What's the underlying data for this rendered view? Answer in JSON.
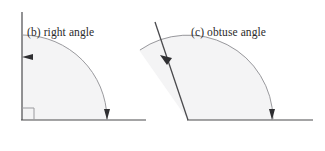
{
  "figure": {
    "width": 325,
    "height": 151,
    "background_color": "#ffffff",
    "line_color": "#3a3a3a",
    "sector_fill_color": "#f4f4f5",
    "sector_stroke_color": "#9b9b9b",
    "text_color": "#2b2b2b"
  },
  "panels": [
    {
      "id": "right-angle",
      "caption": "(b) right angle",
      "angle_degrees": 90,
      "vertex": {
        "x": 22,
        "y": 120
      },
      "rays": [
        {
          "name": "vertical-ray",
          "end_x": 22,
          "end_y": 12
        },
        {
          "name": "horizontal-ray",
          "end_x": 146,
          "end_y": 120
        }
      ],
      "arc": {
        "radius": 85,
        "start_angle_degrees": 0,
        "end_angle_degrees": 90,
        "arrow_start": {
          "x": 107,
          "y": 118,
          "direction": "down"
        },
        "arrow_end": {
          "x": 27,
          "y": 57,
          "direction": "left"
        }
      },
      "right_angle_marker": {
        "size": 12,
        "present": true
      }
    },
    {
      "id": "obtuse-angle",
      "caption": "(c) obtuse angle",
      "angle_degrees": 125,
      "vertex": {
        "x": 188,
        "y": 120
      },
      "rays": [
        {
          "name": "slanted-ray",
          "end_x": 155,
          "end_y": 22
        },
        {
          "name": "horizontal-ray",
          "end_x": 313,
          "end_y": 120
        }
      ],
      "arc": {
        "radius": 85,
        "start_angle_degrees": 0,
        "end_angle_degrees": 125,
        "arrow_start": {
          "x": 272,
          "y": 118,
          "direction": "down"
        },
        "arrow_end": {
          "x": 163,
          "y": 62,
          "direction": "up-left"
        }
      },
      "right_angle_marker": {
        "size": 0,
        "present": false
      }
    }
  ]
}
